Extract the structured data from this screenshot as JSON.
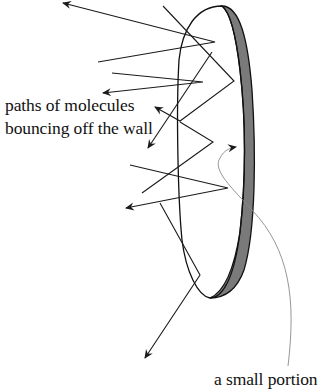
{
  "figure": {
    "labels": {
      "paths_line1": "paths of molecules",
      "paths_line2": "bouncing off the wall",
      "small_portion": "a small portion"
    },
    "colors": {
      "line": "#1a1a1a",
      "wall_band": "#7a7a7a",
      "pointer_curve": "#8a8a8a",
      "background": "#ffffff"
    },
    "wall": {
      "shape": "tilted ellipse with thick shaded right edge",
      "outline_color": "#111111",
      "band_color": "#7a7a7a"
    },
    "molecule_paths": [
      {
        "id": "path-1",
        "points": [
          [
            98,
            62
          ],
          [
            215,
            42
          ],
          [
            63,
            3
          ]
        ],
        "arrow_at_end": true
      },
      {
        "id": "path-2",
        "points": [
          [
            112,
            73
          ],
          [
            203,
            82
          ],
          [
            103,
            93
          ]
        ],
        "arrow_at_end": true
      },
      {
        "id": "path-3",
        "points": [
          [
            163,
            6
          ],
          [
            234,
            81
          ],
          [
            180,
            121
          ],
          [
            155,
            107
          ]
        ],
        "arrow_at_end": true
      },
      {
        "id": "path-4",
        "points": [
          [
            212,
            52
          ],
          [
            148,
            148
          ]
        ],
        "arrow_at_end": true
      },
      {
        "id": "path-5",
        "points": [
          [
            142,
            193
          ],
          [
            213,
            142
          ],
          [
            180,
            122
          ]
        ],
        "arrow_at_end": false
      },
      {
        "id": "path-6",
        "points": [
          [
            130,
            165
          ],
          [
            228,
            188
          ],
          [
            126,
            208
          ]
        ],
        "arrow_at_end": true
      },
      {
        "id": "path-7",
        "points": [
          [
            160,
            203
          ],
          [
            200,
            275
          ],
          [
            145,
            358
          ]
        ],
        "arrow_at_end": true
      }
    ],
    "pointer_curve": {
      "from_label": "a small portion",
      "to": "wall region",
      "arrow_at": [
        236,
        147
      ]
    }
  }
}
